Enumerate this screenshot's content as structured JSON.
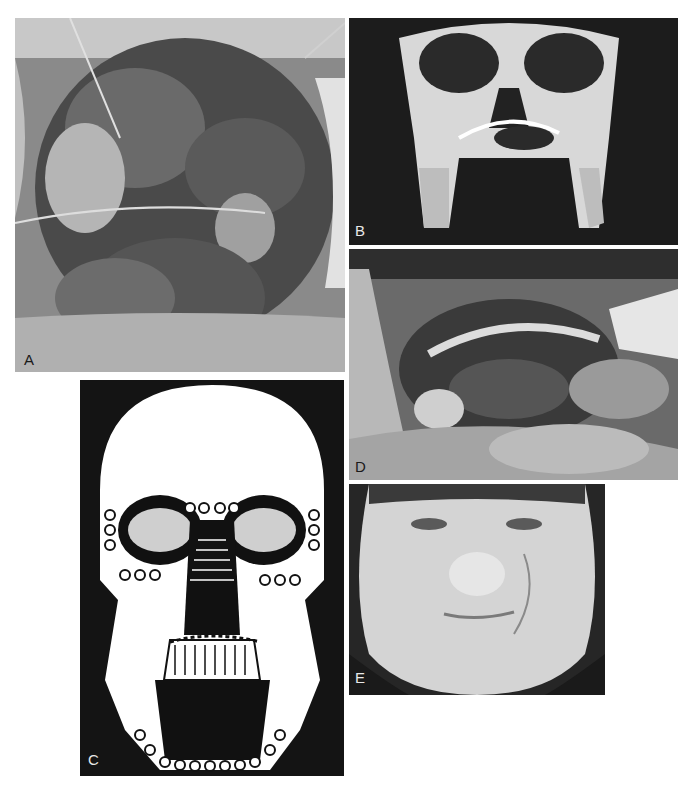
{
  "figure": {
    "panels": [
      {
        "id": "A",
        "label": "A",
        "description": "Intraoperative photograph of open facial wound with exposed tissue and wire",
        "tone": "photo-color-grayscale"
      },
      {
        "id": "B",
        "label": "B",
        "description": "Three-dimensional CT reconstruction of skull showing fractures with fixation plate",
        "tone": "ct-grayscale"
      },
      {
        "id": "C",
        "label": "C",
        "description": "Schematic drawing of skull with miniplates and screws fixing facial fractures",
        "tone": "line-drawing"
      },
      {
        "id": "D",
        "label": "D",
        "description": "Intraoperative photograph of mandibular reconstruction plate through oral cavity",
        "tone": "photo-grayscale"
      },
      {
        "id": "E",
        "label": "E",
        "description": "Postoperative frontal photograph of patient face with healed scars",
        "tone": "photo-grayscale"
      }
    ]
  }
}
